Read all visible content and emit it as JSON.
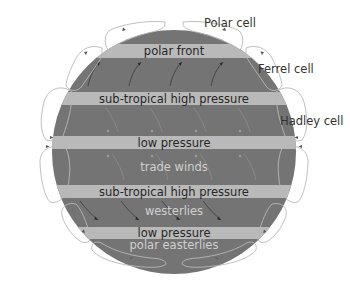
{
  "diagram": {
    "colors": {
      "planet": "#747474",
      "band": "#b9b9b9",
      "band_text": "#262626",
      "wind_text": "#cfcfcf",
      "cell_outline": "#b8b8b8"
    },
    "bands": [
      {
        "label": "polar front",
        "y": 44,
        "h": 14
      },
      {
        "label": "sub-tropical high pressure",
        "y": 92,
        "h": 13
      },
      {
        "label": "low pressure",
        "y": 136,
        "h": 13
      },
      {
        "label": "sub-tropical high pressure",
        "y": 185,
        "h": 13
      },
      {
        "label": "low pressure",
        "y": 227,
        "h": 12
      }
    ],
    "winds": [
      {
        "label": "trade winds"
      },
      {
        "label": "westerlies"
      },
      {
        "label": "polar easterlies"
      }
    ],
    "cells": [
      {
        "label": "Polar cell"
      },
      {
        "label": "Ferrel cell"
      },
      {
        "label": "Hadley cell"
      }
    ]
  }
}
